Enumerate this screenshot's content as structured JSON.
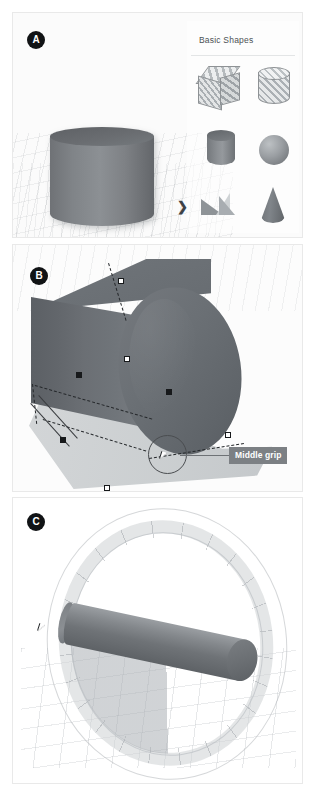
{
  "figure": {
    "background": "#ffffff",
    "border_color": "#e9e9e9"
  },
  "panels": [
    {
      "badge": "A",
      "caption": "",
      "palette": {
        "title": "Basic Shapes",
        "expand_chevron": "❯",
        "shapes": [
          {
            "label": "Box",
            "icon": "box-hatched-icon"
          },
          {
            "label": "Cylinder",
            "icon": "cylinder-hatched-icon"
          },
          {
            "label": "Cylinder",
            "icon": "cylinder-solid-icon"
          },
          {
            "label": "Sphere",
            "icon": "sphere-icon"
          },
          {
            "label": "Pyramid",
            "icon": "pyramid-icon"
          },
          {
            "label": "Cone",
            "icon": "cone-icon"
          }
        ]
      },
      "viewport_object": "grey-cylinder-solid"
    },
    {
      "badge": "B",
      "callout": {
        "label": "Middle grip",
        "background": "#7c8084",
        "text_color": "#ffffff"
      },
      "viewport_object": "extruded-cylinder-selected",
      "grips": [
        {
          "type": "square-light",
          "name": "top-middle-grip"
        },
        {
          "type": "square-light",
          "name": "face-middle-grip"
        },
        {
          "type": "square-dark",
          "name": "center-grip"
        },
        {
          "type": "square-dark",
          "name": "base-center-grip"
        },
        {
          "type": "square-light",
          "name": "corner-grip-right"
        },
        {
          "type": "square-dark",
          "name": "edge-grip-left"
        },
        {
          "type": "square-light",
          "name": "corner-grip-bottom"
        }
      ],
      "cursor": "arrow-cursor"
    },
    {
      "badge": "C",
      "viewport_object": "rotating-cylinder-with-protractor",
      "protractor": {
        "sweep_label": "",
        "tick_interval_deg": 15
      },
      "cursor": "arrow-cursor"
    }
  ],
  "colors": {
    "badge_bg": "#111315",
    "badge_text": "#ffffff",
    "solid_grey": "#7e8286",
    "callout_grey": "#7c8084",
    "grip_outline": "#17191b",
    "panel_border": "#e9e9e9"
  }
}
